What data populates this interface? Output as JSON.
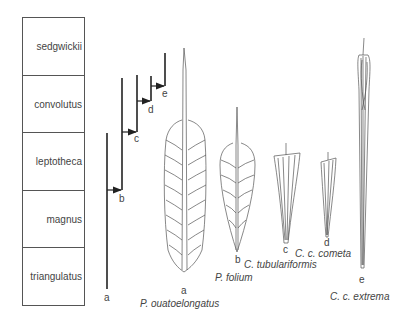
{
  "zones": [
    {
      "name": "sedgwickii"
    },
    {
      "name": "convolutus"
    },
    {
      "name": "leptotheca"
    },
    {
      "name": "magnus"
    },
    {
      "name": "triangulatus"
    }
  ],
  "lineages": [
    {
      "label": "a"
    },
    {
      "label": "b"
    },
    {
      "label": "c"
    },
    {
      "label": "d"
    },
    {
      "label": "e"
    }
  ],
  "specimens": [
    {
      "label": "a",
      "name": "P. ouatoelongatus"
    },
    {
      "label": "b",
      "name": "P. folium"
    },
    {
      "label": "c",
      "name": "C. tubulariformis"
    },
    {
      "label": "d",
      "name": "C. c. cometa"
    },
    {
      "label": "e",
      "name": "C. c. extrema"
    }
  ]
}
